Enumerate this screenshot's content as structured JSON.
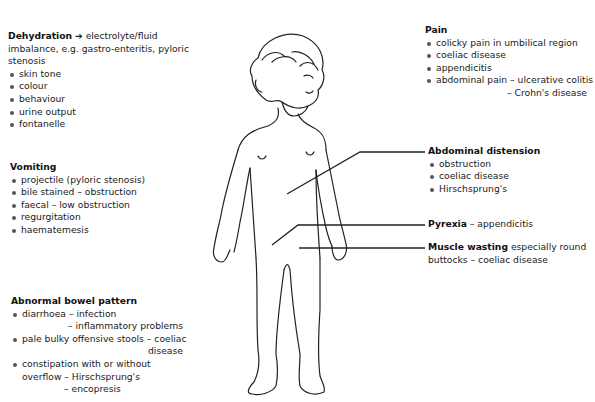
{
  "dehydration": {
    "title": "Dehydration",
    "arrow": "➔",
    "lead": "electrolyte/fluid",
    "desc": "imbalance, e.g. gastro-enteritis, pyloric stenosis",
    "items": [
      "skin tone",
      "colour",
      "behaviour",
      "urine output",
      "fontanelle"
    ]
  },
  "vomiting": {
    "title": "Vomiting",
    "items": [
      "projectile (pyloric stenosis)",
      "bile stained – obstruction",
      "faecal – low obstruction",
      "regurgitation",
      "haematemesis"
    ]
  },
  "bowel": {
    "title": "Abnormal bowel pattern",
    "item1": "diarrhoea – infection",
    "item1_cont": "– inflammatory problems",
    "item2": "pale bulky offensive stools – coeliac",
    "item2_cont": "disease",
    "item3": "constipation with or without",
    "item3_cont1": "overflow – Hirschsprung's",
    "item3_cont2": "– encopresis"
  },
  "pain": {
    "title": "Pain",
    "items": [
      "colicky pain in umbilical region",
      "coeliac disease",
      "appendicitis"
    ],
    "item4": "abdominal pain –  ulcerative colitis",
    "item4_cont": "–  Crohn's disease"
  },
  "distension": {
    "title": "Abdominal distension",
    "items": [
      "obstruction",
      "coeliac disease",
      "Hirschsprung's"
    ]
  },
  "pyrexia": {
    "title": "Pyrexia",
    "text": " – appendicitis"
  },
  "wasting": {
    "title": "Muscle wasting",
    "text": " especially round",
    "cont": "buttocks – coeliac disease"
  },
  "figure": {
    "line_color": "#222222"
  }
}
